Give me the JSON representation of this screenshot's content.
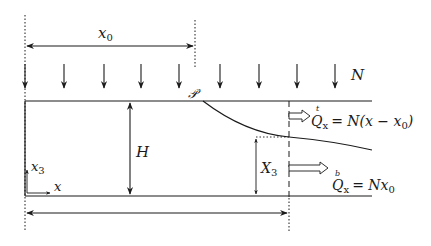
{
  "diagram": {
    "colors": {
      "stroke": "#1a1a1a",
      "background": "#ffffff"
    },
    "labels": {
      "x0": "x",
      "x0_sub": "0",
      "load": "N",
      "point": "𝒫",
      "height": "H",
      "X3": "X",
      "X3_sub": "3",
      "axis_x": "x",
      "axis_x3": "x",
      "axis_x3_sub": "3",
      "q_top_accent": "t",
      "q_top": "Q",
      "q_top_sub": "x",
      "q_top_rhs": "= N(x − x",
      "q_top_rhs_sub": "0",
      "q_top_rhs_end": ")",
      "q_bot_accent": "b",
      "q_bot": "Q",
      "q_bot_sub": "x",
      "q_bot_rhs": "= Nx",
      "q_bot_rhs_sub": "0"
    },
    "load_arrow_x_positions": [
      25,
      64,
      104,
      141,
      179,
      220,
      259,
      297,
      335
    ],
    "icons": {
      "load_arrow": "down-arrow-icon",
      "flux_arrow": "hollow-right-arrow-icon"
    }
  }
}
